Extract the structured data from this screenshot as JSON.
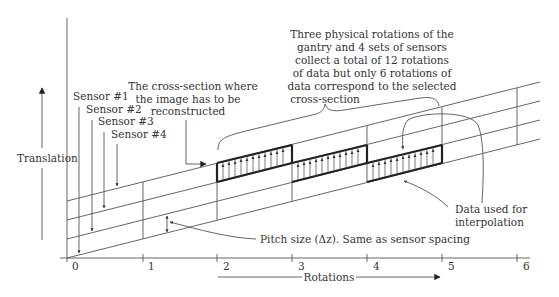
{
  "diagram": {
    "axes": {
      "x_label": "Rotations",
      "y_label": "Translation",
      "x_ticks": [
        "0",
        "1",
        "2",
        "3",
        "4",
        "5",
        "6"
      ]
    },
    "sensors": [
      {
        "label": "Sensor  #1"
      },
      {
        "label": "Sensor #2"
      },
      {
        "label": "Sensor #3"
      },
      {
        "label": "Sensor #4"
      }
    ],
    "annotations": {
      "cross_section": [
        "The cross-section where",
        "the image has to be",
        "reconstructed"
      ],
      "rotations_note": [
        "Three physical rotations of the",
        "gantry and 4 sets of sensors",
        "collect a total of 12 rotations",
        "of data but only 6 rotations of",
        "data correspond to the selected",
        "cross-section"
      ],
      "interpolation": [
        "Data used for",
        "interpolation"
      ],
      "pitch": "Pitch size (Δz). Same as sensor spacing"
    },
    "colors": {
      "line": "#555555",
      "bold": "#222222",
      "text": "#333333",
      "background": "#ffffff"
    }
  }
}
